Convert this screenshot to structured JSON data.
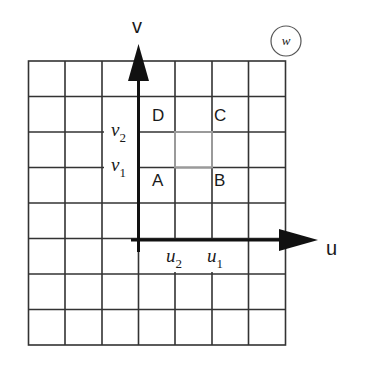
{
  "figure": {
    "panel_label": "w",
    "axes": {
      "horizontal": {
        "label": "u",
        "ticks": [
          "u2",
          "u1"
        ]
      },
      "vertical": {
        "label": "v",
        "ticks": [
          "v2",
          "v1"
        ]
      }
    },
    "tick_labels": {
      "u2": {
        "base": "u",
        "sub": "2"
      },
      "u1": {
        "base": "u",
        "sub": "1"
      },
      "v2": {
        "base": "v",
        "sub": "2"
      },
      "v1": {
        "base": "v",
        "sub": "1"
      }
    },
    "points": {
      "A": "A",
      "B": "B",
      "C": "C",
      "D": "D"
    },
    "grid": {
      "columns": 7,
      "rows": 8
    },
    "highlighted_cell": "square bounded by u2,u1 and v1,v2 (gray)",
    "colors": {
      "grid_line": "#333333",
      "axis": "#111111",
      "highlight": "#9a9a9a"
    }
  }
}
